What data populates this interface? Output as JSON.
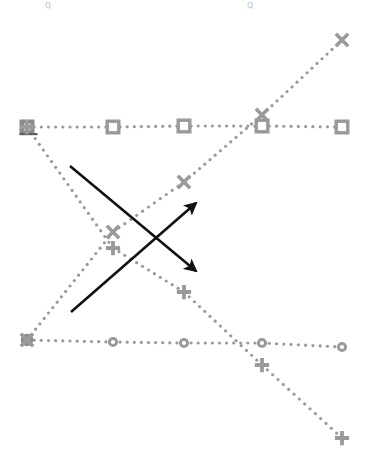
{
  "figure": {
    "title": "",
    "background_color": "#ffffff",
    "width": 371,
    "height": 465,
    "artifact_left": "g",
    "artifact_right": "g"
  },
  "style": {
    "series_color": "#9a9a9a",
    "series_color_dark": "#7d7d7d",
    "annotation_color": "#111111",
    "dot_radius": 1.6,
    "dash_pattern": "0.5 5.5",
    "line_width": 2
  },
  "chart_data": {
    "type": "line",
    "title": "",
    "subtitle": "",
    "xlabel": "",
    "ylabel": "",
    "xlim": [
      0,
      371
    ],
    "ylim": [
      465,
      0
    ],
    "grid": false,
    "legend": "none",
    "axes_visible": false,
    "linestyle": "dotted",
    "note": "Four dotted marker series plotted in pixel coordinates; y increases downward in image space.",
    "x": [
      27,
      113,
      184,
      262,
      342
    ],
    "series": [
      {
        "name": "squares",
        "marker": "square",
        "marker_size": 15,
        "color": "#9a9a9a",
        "values": [
          127,
          127,
          126,
          126,
          127
        ],
        "first_marker_filled": true
      },
      {
        "name": "circles",
        "marker": "circle",
        "marker_size": 10,
        "color": "#9a9a9a",
        "values": [
          340,
          342,
          343,
          343,
          347
        ],
        "first_marker_filled": true
      },
      {
        "name": "crosses",
        "marker": "x",
        "marker_size": 15,
        "color": "#9a9a9a",
        "values": [
          340,
          232,
          182,
          115,
          40
        ],
        "first_marker_filled": false
      },
      {
        "name": "plus",
        "marker": "plus",
        "marker_size": 15,
        "color": "#9a9a9a",
        "values": [
          127,
          248,
          292,
          365,
          438
        ],
        "first_marker_filled": false
      }
    ],
    "annotations": [
      {
        "name": "arrow-down-right",
        "type": "arrow",
        "color": "#111111",
        "x1": 70,
        "y1": 166,
        "x2": 196,
        "y2": 271,
        "label": ""
      },
      {
        "name": "arrow-up-right",
        "type": "arrow",
        "color": "#111111",
        "x1": 71,
        "y1": 312,
        "x2": 196,
        "y2": 203,
        "label": ""
      }
    ]
  }
}
